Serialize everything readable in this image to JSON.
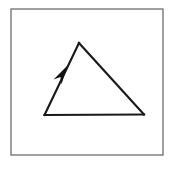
{
  "figure": {
    "title": "Triangle with directed side",
    "background_color": "#ffffff",
    "canvas": {
      "width": 174,
      "height": 170
    },
    "frame": {
      "name": "border-frame",
      "x": 11,
      "y": 9,
      "width": 152,
      "height": 146,
      "stroke_color": "#6e6e6e",
      "stroke_width": 1.3,
      "fill_color": "#ffffff"
    },
    "shape": {
      "name": "triangle",
      "type": "triangle",
      "stroke_color": "#1a1a1a",
      "stroke_width": 2.1,
      "fill": "none",
      "vertices": [
        {
          "label": "apex",
          "x": 79,
          "y": 43
        },
        {
          "label": "bottom-right",
          "x": 144,
          "y": 114.5
        },
        {
          "label": "bottom-left",
          "x": 44.5,
          "y": 115
        }
      ],
      "edges": [
        {
          "name": "left-edge",
          "from": "bottom-left",
          "to": "apex",
          "directed": true
        },
        {
          "name": "right-edge",
          "from": "apex",
          "to": "bottom-right",
          "directed": false
        },
        {
          "name": "bottom-edge",
          "from": "bottom-right",
          "to": "bottom-left",
          "directed": false
        }
      ]
    },
    "arrow": {
      "name": "direction-arrow",
      "on_edge": "left-edge",
      "direction": "up-right",
      "tip": {
        "x": 67.5,
        "y": 65.5
      },
      "tail": {
        "x": 57.5,
        "y": 82.0
      },
      "position_along_edge": 0.62,
      "fill_color": "#121212",
      "half_width": 4.6
    }
  }
}
